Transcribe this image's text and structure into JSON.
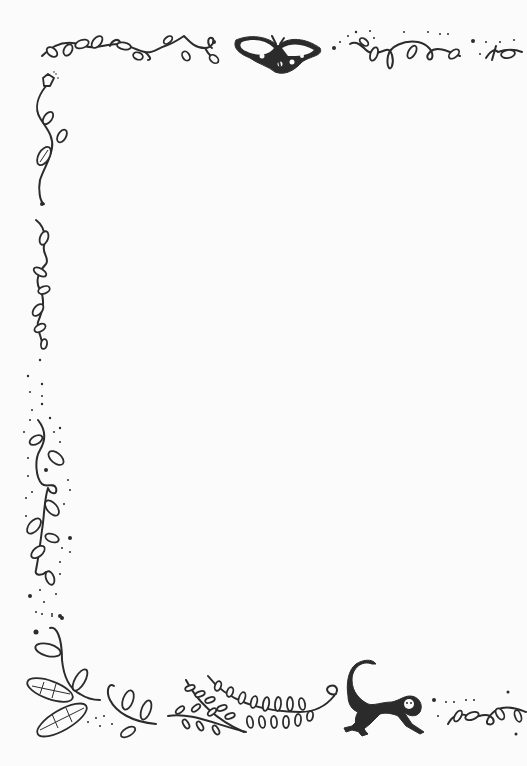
{
  "page": {
    "type": "decorative stationery border",
    "background_color": "#fbfbfb",
    "ink_color": "#2b2b2b",
    "writing_area_text": ""
  },
  "decorations": {
    "top_border": [
      "leafy-vine-left",
      "moth",
      "dotted-leafy-vine-right"
    ],
    "left_border": [
      "flowering-vine",
      "leafy-vine",
      "dotted-leafy-vine"
    ],
    "bottom_border": [
      "large-leaf-sprig",
      "small-curled-sprig",
      "fern-fronds",
      "monkey",
      "dotted-leafy-vine"
    ]
  }
}
